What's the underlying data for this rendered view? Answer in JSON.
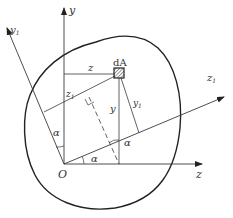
{
  "figure": {
    "type": "moment-of-inertia-rotated-axes",
    "colors": {
      "line": "#3a3a3a",
      "boundary": "#222222",
      "text": "#333333",
      "background": "#ffffff"
    },
    "labels": {
      "y_axis": "y",
      "z_axis": "z",
      "y1_axis_main": "y",
      "y1_axis_sub": "1",
      "z1_axis_main": "z",
      "z1_axis_sub": "1",
      "origin": "O",
      "element": "dA",
      "coord_z": "z",
      "coord_y": "y",
      "coord_z1_main": "z",
      "coord_z1_sub": "1",
      "coord_y1_main": "y",
      "coord_y1_sub": "1",
      "angle_1": "α",
      "angle_2": "α",
      "angle_3": "α"
    }
  }
}
